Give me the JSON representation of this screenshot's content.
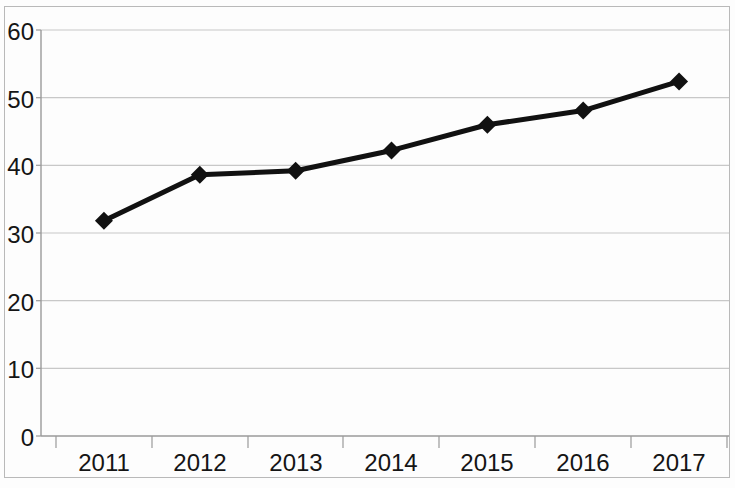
{
  "chart_data": {
    "type": "line",
    "title": "",
    "subtitle": "",
    "xlabel": "",
    "ylabel": "",
    "categories": [
      "2011",
      "2012",
      "2013",
      "2014",
      "2015",
      "2016",
      "2017"
    ],
    "values": [
      31.8,
      38.6,
      39.2,
      42.2,
      46.0,
      48.1,
      52.4
    ],
    "series": [
      {
        "name": "",
        "values": [
          31.8,
          38.6,
          39.2,
          42.2,
          46.0,
          48.1,
          52.4
        ]
      }
    ],
    "ylim": [
      0,
      60
    ],
    "y_ticks": [
      "0",
      "10",
      "20",
      "30",
      "40",
      "50",
      "60"
    ],
    "y_tick_values": [
      0,
      10,
      20,
      30,
      40,
      50,
      60
    ],
    "x_ticks": [
      "2011",
      "2012",
      "2013",
      "2014",
      "2015",
      "2016",
      "2017"
    ],
    "grid": "horizontal",
    "legend": "none",
    "marker": "diamond",
    "line_color": "#111111",
    "marker_color": "#111111",
    "grid_color": "#c8c8c8",
    "axis_color": "#9a9a9a",
    "background_color": "#fdfdfd",
    "annotations": []
  },
  "axes": {
    "y_axis_name": "value-axis",
    "x_axis_name": "year-axis"
  }
}
